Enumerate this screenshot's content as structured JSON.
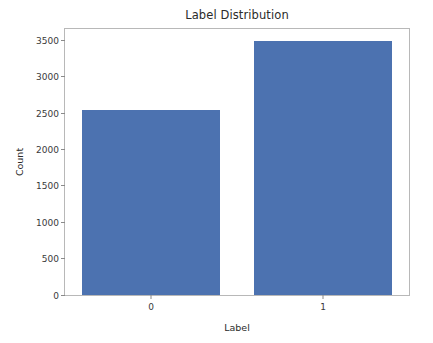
{
  "chart_data": {
    "type": "bar",
    "title": "Label Distribution",
    "xlabel": "Label",
    "ylabel": "Count",
    "categories": [
      "0",
      "1"
    ],
    "values": [
      2540,
      3490
    ],
    "series": [
      {
        "name": "Count",
        "values": [
          2540,
          3490
        ]
      }
    ],
    "ylim": [
      0,
      3660
    ],
    "xlim": [
      -0.5,
      1.5
    ],
    "yticks": [
      0,
      500,
      1000,
      1500,
      2000,
      2500,
      3000,
      3500
    ],
    "ytick_labels": [
      "0",
      "500",
      "1000",
      "1500",
      "2000",
      "2500",
      "3000",
      "3500"
    ],
    "xticks": [
      0,
      1
    ],
    "xtick_labels": [
      "0",
      "1"
    ],
    "grid": false,
    "legend": false,
    "bar_color": "#4c72b0",
    "spine_color": "#b8b8b8",
    "background": "#ffffff",
    "bar_width_fraction": 0.8
  }
}
